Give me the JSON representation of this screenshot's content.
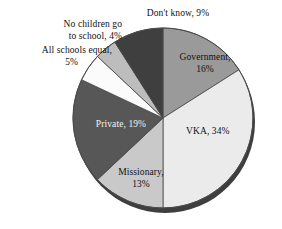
{
  "chart_data": {
    "type": "pie",
    "title": "",
    "subtitle": "",
    "xlabel": "",
    "ylabel": "",
    "legend_position": "none",
    "grid": false,
    "total_percent": 100,
    "categories": [
      "Government",
      "VKA",
      "Missionary",
      "Private",
      "All schools equal",
      "No children go to school",
      "Don't know"
    ],
    "values": [
      16,
      34,
      13,
      19,
      5,
      4,
      9
    ],
    "slices": [
      {
        "name": "Government",
        "label": "Government,\n16%",
        "value": 16,
        "color": "#9a9a9a",
        "label_placement": "inside",
        "label_color": "#111111"
      },
      {
        "name": "VKA",
        "label": "VKA, 34%",
        "value": 34,
        "color": "#ebebeb",
        "label_placement": "inside",
        "label_color": "#111111"
      },
      {
        "name": "Missionary",
        "label": "Missionary,\n13%",
        "value": 13,
        "color": "#c9c9c9",
        "label_placement": "inside",
        "label_color": "#111111"
      },
      {
        "name": "Private",
        "label": "Private, 19%",
        "value": 19,
        "color": "#575757",
        "label_placement": "inside",
        "label_color": "#f2f2f2"
      },
      {
        "name": "All schools equal",
        "label": "All schools equal,\n5%",
        "value": 5,
        "color": "#fbfbfb",
        "label_placement": "outside",
        "label_color": "#111111"
      },
      {
        "name": "No children go to school",
        "label": "No children go\nto school, 4%",
        "value": 4,
        "color": "#bdbdbd",
        "label_placement": "outside",
        "label_color": "#111111"
      },
      {
        "name": "Don't know",
        "label": "Don't know, 9%",
        "value": 9,
        "color": "#3f3f3f",
        "label_placement": "outside",
        "label_color": "#111111"
      }
    ],
    "colors": {
      "government": "#9a9a9a",
      "vka": "#ebebeb",
      "missionary": "#c9c9c9",
      "private": "#575757",
      "all_schools_equal": "#fbfbfb",
      "no_children": "#bdbdbd",
      "dont_know": "#3f3f3f",
      "outline": "#4a4a4a",
      "shadow": "#1c1c1c",
      "background": "#ffffff"
    }
  },
  "labels": {
    "dont_know": "Don't know, 9%",
    "no_children_line1": "No children go",
    "no_children_line2": "to school, 4%",
    "all_schools_line1": "All schools equal,",
    "all_schools_line2": "5%",
    "government_line1": "Government,",
    "government_line2": "16%",
    "vka": "VKA, 34%",
    "missionary_line1": "Missionary,",
    "missionary_line2": "13%",
    "private": "Private, 19%"
  }
}
